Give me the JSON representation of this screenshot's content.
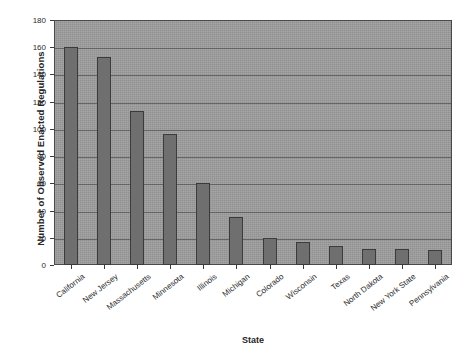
{
  "chart_data": {
    "type": "bar",
    "title": "",
    "xlabel": "State",
    "ylabel": "Number of Observed Enacted Regulations",
    "categories": [
      "California",
      "New Jersey",
      "Massachusetts",
      "Minnesota",
      "Illinois",
      "Michigan",
      "Colorado",
      "Wisconsin",
      "Texas",
      "North Dakota",
      "New York State",
      "Pennsylvania"
    ],
    "values": [
      160,
      153,
      113,
      96,
      60,
      35,
      20,
      17,
      14,
      12,
      12,
      11
    ],
    "ylim": [
      0,
      180
    ],
    "yticks": [
      0,
      20,
      40,
      60,
      80,
      100,
      120,
      140,
      160,
      180
    ],
    "ytick_labels": [
      "0",
      "20",
      "40",
      "60",
      "80",
      "100",
      "120",
      "140",
      "160",
      "180"
    ],
    "grid": true,
    "legend": false,
    "legend_position": "none",
    "colors": {
      "bar_fill": "#6f6f6f",
      "bar_edge": "#3b3b3b",
      "plot_background": "#9b9b9b",
      "gridline": "#5a5a5a",
      "figure_background": "#ffffff",
      "text": "#262626"
    }
  }
}
